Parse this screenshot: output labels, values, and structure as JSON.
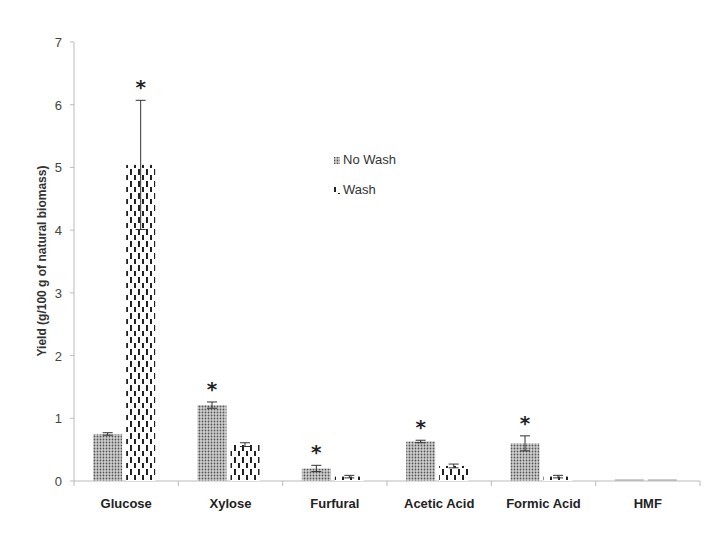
{
  "chart_data": {
    "type": "bar",
    "title": "",
    "xlabel": "",
    "ylabel": "Yield (g/100 g of natural biomass)",
    "ylim": [
      0,
      7
    ],
    "yticks": [
      0,
      1,
      2,
      3,
      4,
      5,
      6,
      7
    ],
    "grid": false,
    "legend_position": "upper center (inside plot)",
    "categories": [
      "Glucose",
      "Xylose",
      "Furfural",
      "Acetic Acid",
      "Formic Acid",
      "HMF"
    ],
    "series": [
      {
        "name": "No Wash",
        "pattern": "dense-dots",
        "values": [
          0.75,
          1.21,
          0.2,
          0.63,
          0.6,
          0.0
        ],
        "errors": [
          0.02,
          0.05,
          0.05,
          0.02,
          0.12,
          0.0
        ]
      },
      {
        "name": "Wash",
        "pattern": "dashed-vertical",
        "values": [
          5.04,
          0.58,
          0.07,
          0.24,
          0.07,
          0.0
        ],
        "errors": [
          1.03,
          0.03,
          0.02,
          0.03,
          0.02,
          0.0
        ]
      }
    ],
    "annotations": [
      {
        "text": "*",
        "category": "Glucose",
        "series": "Wash"
      },
      {
        "text": "*",
        "category": "Xylose",
        "series": "No Wash"
      },
      {
        "text": "*",
        "category": "Furfural",
        "series": "No Wash"
      },
      {
        "text": "*",
        "category": "Acetic Acid",
        "series": "No Wash"
      },
      {
        "text": "*",
        "category": "Formic Acid",
        "series": "No Wash"
      }
    ]
  },
  "legend": {
    "items": [
      {
        "label": "No Wash"
      },
      {
        "label": "Wash"
      }
    ]
  },
  "axis": {
    "ylabel": "Yield (g/100 g of natural biomass)"
  }
}
